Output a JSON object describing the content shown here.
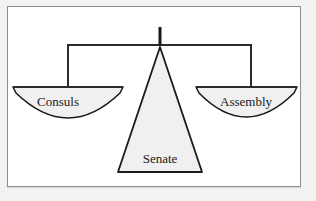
{
  "figure": {
    "type": "balance-scale-diagram",
    "background_color": "#ffffff",
    "page_color": "#f2f2f1",
    "frame_color": "#8e8e90",
    "shape_fill": "#f0f0f0",
    "shape_stroke": "#1a1a1a",
    "beam_color": "#2b2b2b"
  },
  "elements": {
    "post": {
      "name": "balance-post",
      "x": 160,
      "y_top": 27,
      "y_bottom": 46,
      "width": 3
    },
    "beam": {
      "name": "balance-beam",
      "left_x": 68,
      "right_x": 251,
      "y": 45,
      "hanger_drop_y": 88
    },
    "fulcrum": {
      "name": "fulcrum-triangle",
      "label": "Senate",
      "apex_x": 160,
      "apex_y": 46,
      "base_left_x": 118,
      "base_right_x": 202,
      "base_y": 172,
      "label_x": 160,
      "label_y": 163
    },
    "left_pan": {
      "name": "left-scale-pan",
      "label": "Consuls",
      "left_x": 13,
      "right_x": 123,
      "top_y": 87,
      "bottom_y": 134,
      "label_x": 58,
      "label_y": 106
    },
    "right_pan": {
      "name": "right-scale-pan",
      "label": "Assembly",
      "left_x": 196,
      "right_x": 297,
      "top_y": 87,
      "bottom_y": 134,
      "label_x": 246,
      "label_y": 106
    }
  },
  "labels": {
    "consuls": "Consuls",
    "senate": "Senate",
    "assembly": "Assembly"
  }
}
